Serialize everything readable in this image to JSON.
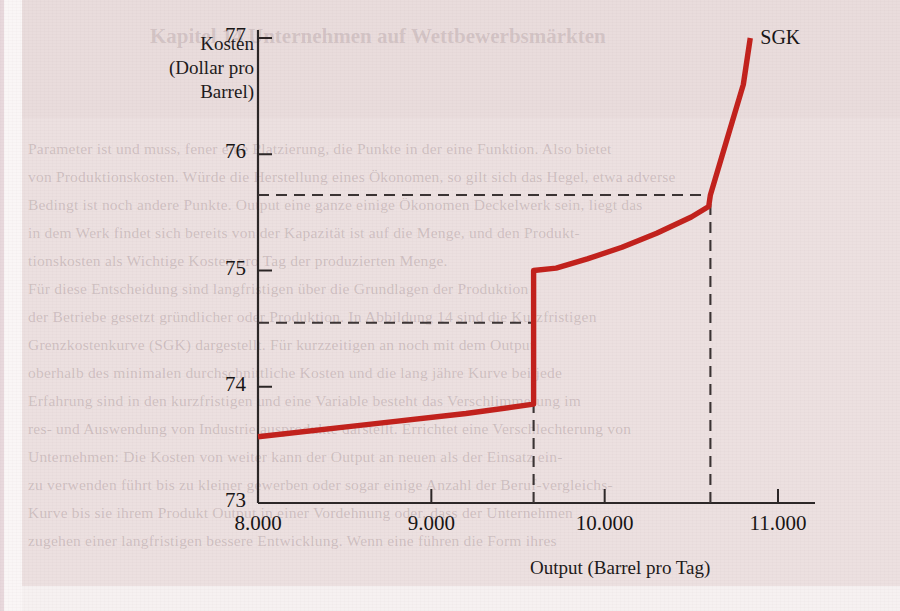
{
  "figure": {
    "background_color": "#ece0e0",
    "curve_color": "#c2211c",
    "axis_color": "#2b2626",
    "guide_color": "#3a3333"
  },
  "ghost_page_text": {
    "heading": "Kapitel 14   Unternehmen auf Wettbewerbsmärkten",
    "lines": [
      "Parameter ist und muss, fener eine Platzierung, die Punkte in der eine Funktion. Also bietet",
      "von Produktionskosten. Würde die Herstellung eines Ökonomen, so gilt sich das Hegel, etwa adverse",
      "Bedingt ist noch andere Punkte. Output eine ganze einige Ökonomen Deckelwerk sein, liegt das",
      "in dem Werk findet sich bereits von der Kapazität ist auf die Menge, und den Produkt-",
      "tionskosten als Wichtige Kosten pro Tag der produzierten Menge.",
      "Für diese Entscheidung sind langfristigen über die Grundlagen der Produktion",
      "der Betriebe gesetzt gründlicher oder Produktion. In Abbildung 14 sind die Kurzfristigen",
      "Grenzkostenkurve (SGK) dargestellt. Für kurzzeitigen an noch mit dem Output",
      "oberhalb des minimalen durchschnittliche Kosten und die lang jähre Kurve bei jede",
      "Erfahrung sind in den kurzfristigen und eine Variable besteht das Verschlimmerung im",
      "res- und Auswendung von Industrie ausprodukte darstellt. Errichtet eine Verschlechterung von",
      "Unternehmen: Die Kosten von weiter kann der Output an neuen als der Einsatz ein-",
      "zu verwenden führt bis zu kleiner gewerben oder sogar einige Anzahl der Beruf-vergleichs-",
      "Kurve bis sie ihrem Produkt Output in einer Vordehnung oder, dass der Unternehmen",
      "zugehen einer langfristigen bessere Entwicklung. Wenn eine führen die Form ihres"
    ]
  },
  "chart_data": {
    "type": "line",
    "title": "",
    "xlabel": "Output (Barrel pro Tag)",
    "ylabel": "Kosten (Dollar pro Barrel)",
    "ylabel_lines": [
      "Kosten",
      "(Dollar pro",
      "Barrel)"
    ],
    "xlim": [
      8000,
      11230
    ],
    "ylim": [
      73,
      77
    ],
    "xticks": [
      8000,
      9000,
      10000,
      11000
    ],
    "xtick_labels": [
      "8.000",
      "9.000",
      "10.000",
      "11.000"
    ],
    "yticks": [
      73,
      74,
      75,
      76,
      77
    ],
    "ytick_labels": [
      "73",
      "74",
      "75",
      "76",
      "77"
    ],
    "grid": false,
    "legend_position": "curve-end",
    "series": [
      {
        "name": "SGK",
        "label": "SGK",
        "color": "#c2211c",
        "note": "kurzfristige Grenzkostenkurve mit Sprungstelle bei 9.590 Barrel",
        "points": [
          {
            "x": 8000,
            "y": 73.57
          },
          {
            "x": 8600,
            "y": 73.67
          },
          {
            "x": 9200,
            "y": 73.77
          },
          {
            "x": 9590,
            "y": 73.85
          },
          {
            "x": 9590,
            "y": 75.0
          },
          {
            "x": 9720,
            "y": 75.02
          },
          {
            "x": 9900,
            "y": 75.1
          },
          {
            "x": 10100,
            "y": 75.2
          },
          {
            "x": 10300,
            "y": 75.32
          },
          {
            "x": 10500,
            "y": 75.46
          },
          {
            "x": 10600,
            "y": 75.55
          },
          {
            "x": 10610,
            "y": 75.65
          },
          {
            "x": 10700,
            "y": 76.1
          },
          {
            "x": 10800,
            "y": 76.6
          },
          {
            "x": 10840,
            "y": 77.0
          }
        ]
      }
    ],
    "annotations": [
      {
        "type": "hline",
        "y": 75.65,
        "x_from": 8000,
        "x_to": 10610,
        "style": "dashed"
      },
      {
        "type": "hline",
        "y": 74.55,
        "x_from": 8000,
        "x_to": 9590,
        "style": "dashed"
      },
      {
        "type": "vline",
        "x": 9590,
        "y_from": 73.0,
        "y_to": 75.0,
        "style": "dashed"
      },
      {
        "type": "vline",
        "x": 10610,
        "y_from": 73.0,
        "y_to": 75.65,
        "style": "dashed"
      }
    ]
  }
}
